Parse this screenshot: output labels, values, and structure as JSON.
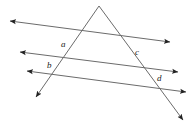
{
  "figure": {
    "background_color": "#ffffff",
    "stroke_color": "#6b6b6b",
    "label_color": "#1a1a1a",
    "stroke_width": 1,
    "width": 194,
    "height": 127
  },
  "lines": [
    {
      "id": "transversal-left",
      "name": "left-transversal",
      "arrows": "end",
      "x1": 99,
      "y1": 6,
      "x2": 36,
      "y2": 97
    },
    {
      "id": "transversal-right",
      "name": "right-transversal",
      "arrows": "end",
      "x1": 99,
      "y1": 6,
      "x2": 183,
      "y2": 120
    },
    {
      "id": "parallel-1",
      "name": "upper-parallel-line",
      "arrows": "both",
      "x1": 10,
      "y1": 21,
      "x2": 170,
      "y2": 42
    },
    {
      "id": "parallel-2",
      "name": "middle-parallel-line",
      "arrows": "both",
      "x1": 20,
      "y1": 52,
      "x2": 178,
      "y2": 72
    },
    {
      "id": "parallel-3",
      "name": "lower-parallel-line",
      "arrows": "both",
      "x1": 27,
      "y1": 71,
      "x2": 186,
      "y2": 92
    }
  ],
  "labels": [
    {
      "id": "label-a",
      "text": "a",
      "x": 61,
      "y": 40
    },
    {
      "id": "label-c",
      "text": "c",
      "x": 135,
      "y": 48
    },
    {
      "id": "label-b",
      "text": "b",
      "x": 47,
      "y": 61
    },
    {
      "id": "label-d",
      "text": "d",
      "x": 157,
      "y": 74
    }
  ]
}
